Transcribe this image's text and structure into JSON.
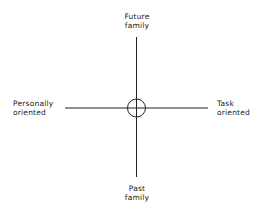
{
  "diagram": {
    "type": "quadrant-axes",
    "labels": {
      "top": [
        "Future",
        "family"
      ],
      "bottom": [
        "Past",
        "family"
      ],
      "left": [
        "Personally",
        "oriented"
      ],
      "right": [
        "Task",
        "oriented"
      ]
    },
    "center_marker": "circle",
    "line_color": "#222222"
  }
}
